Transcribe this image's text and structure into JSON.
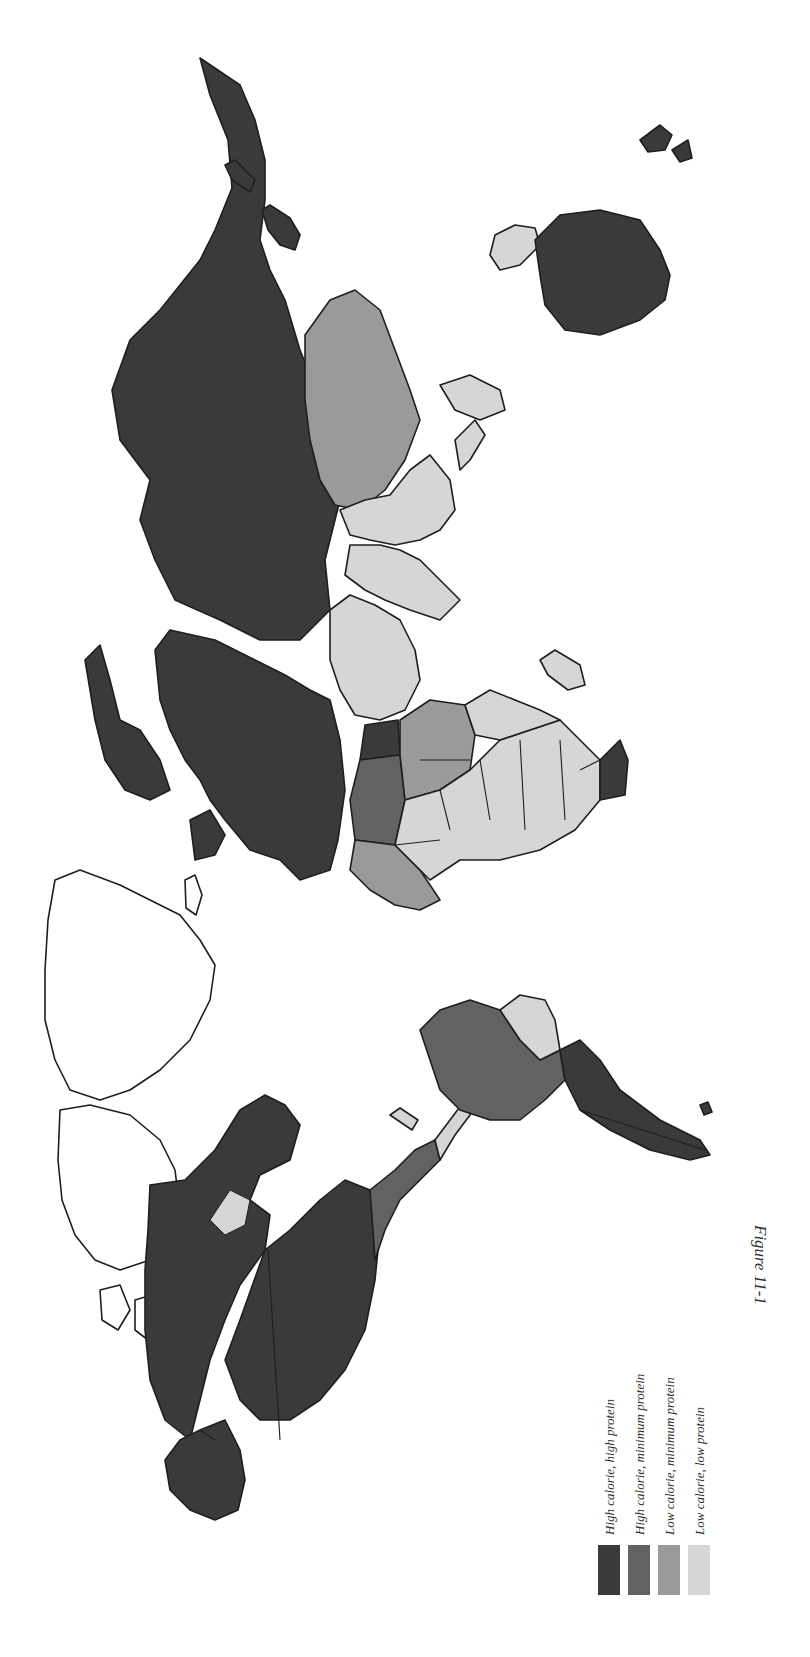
{
  "figure": {
    "caption": "Figure 11-1",
    "orientation": "rotated 90° clockwise (north points left)"
  },
  "legend": {
    "items": [
      {
        "key": "hh",
        "label": "High calorie, high protein",
        "color": "#3a3a3a"
      },
      {
        "key": "hm",
        "label": "High calorie, minimum protein",
        "color": "#626262"
      },
      {
        "key": "lm",
        "label": "Low calorie, minimum protein",
        "color": "#9a9a9a"
      },
      {
        "key": "ll",
        "label": "Low calorie, low protein",
        "color": "#d6d6d6"
      }
    ]
  },
  "map": {
    "regions": [
      {
        "name": "Soviet Union / Northern Asia",
        "class": "hh"
      },
      {
        "name": "Europe",
        "class": "hh"
      },
      {
        "name": "China",
        "class": "lm"
      },
      {
        "name": "India & South Asia",
        "class": "ll"
      },
      {
        "name": "Southeast Asia",
        "class": "ll"
      },
      {
        "name": "Middle East",
        "class": "ll"
      },
      {
        "name": "North Africa (Libya/Egypt)",
        "class": "hh"
      },
      {
        "name": "Northwest Africa",
        "class": "hm"
      },
      {
        "name": "Sahel / Central Africa",
        "class": "lm"
      },
      {
        "name": "Sub-Saharan Africa",
        "class": "ll"
      },
      {
        "name": "South Africa",
        "class": "hh"
      },
      {
        "name": "Madagascar",
        "class": "ll"
      },
      {
        "name": "Australia",
        "class": "hh"
      },
      {
        "name": "New Zealand",
        "class": "hh"
      },
      {
        "name": "Japan",
        "class": "hh"
      },
      {
        "name": "Indonesia / New Guinea",
        "class": "ll"
      },
      {
        "name": "Canada",
        "class": "hh"
      },
      {
        "name": "United States",
        "class": "hh"
      },
      {
        "name": "Alaska",
        "class": "hh"
      },
      {
        "name": "Mexico",
        "class": "hm"
      },
      {
        "name": "Central America",
        "class": "ll"
      },
      {
        "name": "Brazil",
        "class": "hm"
      },
      {
        "name": "Northern South America",
        "class": "ll"
      },
      {
        "name": "Andean South America",
        "class": "ll"
      },
      {
        "name": "Argentina / Uruguay",
        "class": "hh"
      },
      {
        "name": "Greenland",
        "class": "none"
      },
      {
        "name": "Arctic Archipelago",
        "class": "none"
      }
    ]
  }
}
